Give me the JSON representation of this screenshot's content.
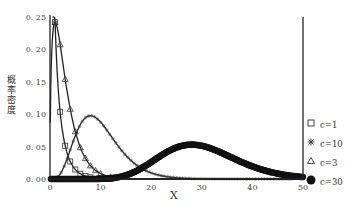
{
  "chart_data": {
    "type": "line",
    "title": "",
    "xlabel": "X",
    "ylabel": "概率密度",
    "xlim": [
      0,
      50
    ],
    "ylim": [
      0,
      0.25
    ],
    "x_ticks": [
      "0",
      "10",
      "20",
      "30",
      "40",
      "50"
    ],
    "y_ticks": [
      "0.00",
      "0.05",
      "0.10",
      "0.15",
      "0.20",
      "0.25"
    ],
    "grid": false,
    "legend_position": "right",
    "series": [
      {
        "name": "c=1",
        "marker": "square",
        "distribution": "chi-square df=1",
        "x": [
          1,
          2,
          3,
          4,
          5,
          6,
          8,
          10
        ],
        "values": [
          0.242,
          0.104,
          0.051,
          0.027,
          0.015,
          0.008,
          0.003,
          0.001
        ]
      },
      {
        "name": "c=10",
        "marker": "asterisk",
        "distribution": "chi-square df=10",
        "x": [
          2,
          4,
          6,
          8,
          10,
          12,
          14,
          16,
          18,
          20,
          25
        ],
        "values": [
          0.015,
          0.054,
          0.088,
          0.098,
          0.088,
          0.068,
          0.047,
          0.03,
          0.018,
          0.01,
          0.002
        ]
      },
      {
        "name": "c=3",
        "marker": "triangle",
        "distribution": "chi-square df=3",
        "x": [
          1,
          2,
          3,
          4,
          5,
          6,
          8,
          10,
          12
        ],
        "values": [
          0.242,
          0.208,
          0.154,
          0.108,
          0.073,
          0.049,
          0.021,
          0.008,
          0.003
        ]
      },
      {
        "name": "c=30",
        "marker": "filled-circle",
        "distribution": "chi-square df=30",
        "x": [
          10,
          15,
          20,
          25,
          28,
          30,
          35,
          40,
          45,
          50
        ],
        "values": [
          0.0003,
          0.004,
          0.02,
          0.044,
          0.0516,
          0.0508,
          0.038,
          0.021,
          0.009,
          0.003
        ]
      }
    ]
  },
  "legend": {
    "items": [
      {
        "symbol": "□",
        "label": "c=1"
      },
      {
        "symbol": "✱",
        "label": "c=10"
      },
      {
        "symbol": "△",
        "label": "c=3"
      },
      {
        "symbol": "●",
        "label": "c=30"
      }
    ]
  }
}
